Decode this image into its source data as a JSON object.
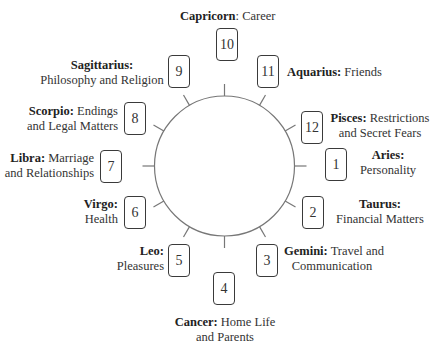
{
  "circle": {
    "cx": 224.5,
    "cy": 166,
    "r": 70,
    "tick_length": 12,
    "stroke": "#777777"
  },
  "houses": [
    {
      "number": "1",
      "sign": "Aries:",
      "meaning": "Personality"
    },
    {
      "number": "2",
      "sign": "Taurus:",
      "meaning": "Financial Matters"
    },
    {
      "number": "3",
      "sign": "Gemini:",
      "meaning": "Travel and Communication",
      "line1": " Travel and",
      "line2": "Communication"
    },
    {
      "number": "4",
      "sign": "Cancer:",
      "meaning": "Home Life and Parents",
      "line1": " Home Life",
      "line2": "and Parents"
    },
    {
      "number": "5",
      "sign": "Leo:",
      "meaning": "Pleasures"
    },
    {
      "number": "6",
      "sign": "Virgo:",
      "meaning": "Health"
    },
    {
      "number": "7",
      "sign": "Libra:",
      "meaning": "Marriage and Relationships",
      "line1": " Marriage",
      "line2": "and Relationships"
    },
    {
      "number": "8",
      "sign": "Scorpio:",
      "meaning": "Endings and Legal Matters",
      "line1": " Endings",
      "line2": "and Legal Matters"
    },
    {
      "number": "9",
      "sign": "Sagittarius:",
      "meaning": "Philosophy and Religion"
    },
    {
      "number": "10",
      "sign": "Capricorn",
      "meaning": "Career",
      "line1": ": Career"
    },
    {
      "number": "11",
      "sign": "Aquarius:",
      "meaning": "Friends",
      "line1": " Friends"
    },
    {
      "number": "12",
      "sign": "Pisces:",
      "meaning": "Restrictions and Secret Fears",
      "line1": " Restrictions",
      "line2": "and Secret Fears"
    }
  ]
}
